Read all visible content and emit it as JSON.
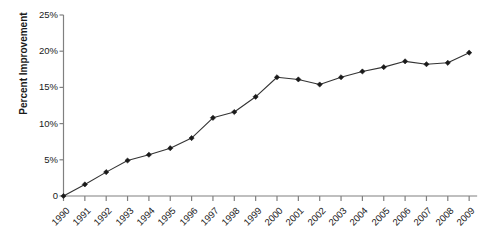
{
  "chart_data": {
    "type": "line",
    "title": "",
    "xlabel": "",
    "ylabel": "Percent Improvement",
    "categories": [
      "1990",
      "1991",
      "1992",
      "1993",
      "1994",
      "1995",
      "1996",
      "1997",
      "1998",
      "1999",
      "2000",
      "2001",
      "2002",
      "2003",
      "2004",
      "2005",
      "2006",
      "2007",
      "2008",
      "2009"
    ],
    "values": [
      0,
      1.6,
      3.3,
      4.9,
      5.7,
      6.6,
      8.0,
      10.8,
      11.6,
      13.7,
      16.4,
      16.1,
      15.4,
      16.4,
      17.2,
      17.8,
      18.6,
      18.2,
      18.4,
      19.8
    ],
    "series": [
      {
        "name": "Percent Improvement",
        "values": [
          0,
          1.6,
          3.3,
          4.9,
          5.7,
          6.6,
          8.0,
          10.8,
          11.6,
          13.7,
          16.4,
          16.1,
          15.4,
          16.4,
          17.2,
          17.8,
          18.6,
          18.2,
          18.4,
          19.8
        ]
      }
    ],
    "ylim": [
      0,
      25
    ],
    "y_ticks": [
      0,
      5,
      10,
      15,
      20,
      25
    ],
    "y_tick_labels": [
      "0",
      "5%",
      "10%",
      "15%",
      "20%",
      "25%"
    ],
    "grid": false,
    "legend": "none",
    "marker": "diamond",
    "line_color": "#333333",
    "marker_color": "#1a1a1a",
    "axis_color": "#808080"
  },
  "axes": {
    "y_title": "Percent Improvement"
  }
}
